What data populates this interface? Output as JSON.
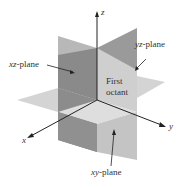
{
  "diagram": {
    "axes": {
      "x": {
        "label": "x"
      },
      "y": {
        "label": "y"
      },
      "z": {
        "label": "z"
      }
    },
    "planes": {
      "xz": {
        "var": "xz",
        "suffix": "-plane",
        "color": "#8c8c8c"
      },
      "yz": {
        "var": "yz",
        "suffix": "-plane",
        "color": "#c8c8c8"
      },
      "xy": {
        "var": "xy",
        "suffix": "-plane",
        "color": "#d9d9d9"
      }
    },
    "octant_label": {
      "line1": "First",
      "line2": "octant"
    },
    "colors": {
      "dark_plane": "#8c8c8c",
      "mid_plane": "#b4b4b4",
      "light_plane": "#d6d6d6",
      "axis": "#222222",
      "text": "#333333"
    }
  }
}
